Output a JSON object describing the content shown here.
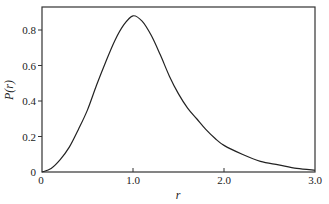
{
  "chart_data": {
    "type": "line",
    "title": "",
    "xlabel": "r",
    "ylabel": "P(r)",
    "xlim": [
      0,
      3.0
    ],
    "ylim": [
      0,
      0.93
    ],
    "grid": false,
    "legend": null,
    "x_ticks": [
      "0",
      "1.0",
      "2.0",
      "3.0"
    ],
    "x_tick_values": [
      0,
      1.0,
      2.0,
      3.0
    ],
    "y_ticks": [
      "0",
      "0.2",
      "0.4",
      "0.6",
      "0.8"
    ],
    "y_tick_values": [
      0,
      0.2,
      0.4,
      0.6,
      0.8
    ],
    "series": [
      {
        "name": "P(r)",
        "color": "#222222",
        "x": [
          0,
          0.1,
          0.2,
          0.3,
          0.4,
          0.5,
          0.6,
          0.7,
          0.8,
          0.9,
          1.0,
          1.1,
          1.2,
          1.3,
          1.4,
          1.5,
          1.6,
          1.7,
          1.8,
          1.9,
          2.0,
          2.2,
          2.4,
          2.6,
          2.8,
          3.0
        ],
        "values": [
          0,
          0.02,
          0.07,
          0.14,
          0.24,
          0.35,
          0.49,
          0.62,
          0.74,
          0.83,
          0.88,
          0.85,
          0.77,
          0.66,
          0.54,
          0.44,
          0.36,
          0.3,
          0.24,
          0.19,
          0.15,
          0.1,
          0.06,
          0.04,
          0.02,
          0.01
        ]
      }
    ]
  }
}
